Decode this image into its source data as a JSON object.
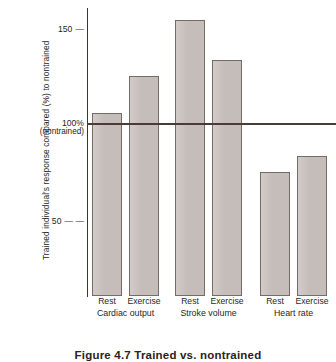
{
  "chart_data": {
    "type": "bar",
    "title": "",
    "caption": "Figure 4.7  Trained vs. nontrained",
    "xlabel": "",
    "ylabel": "Trained individual's response compared (%) to nontrained",
    "ylim": [
      0,
      162
    ],
    "grid": false,
    "legend": "none",
    "yticks": [
      {
        "value": 150,
        "label": "150",
        "dash": "—"
      },
      {
        "value": 100,
        "label": "100%",
        "sublabel": "(nontrained)"
      },
      {
        "value": 50,
        "label": "50",
        "dash": "—  —"
      }
    ],
    "reference_line": {
      "value": 100,
      "label": "100% (nontrained)",
      "color": "#4a3b36"
    },
    "categories": [
      "Rest",
      "Exercise",
      "Rest",
      "Exercise",
      "Rest",
      "Exercise"
    ],
    "groups": [
      {
        "name": "Cardiac output",
        "categories": [
          "Rest",
          "Exercise"
        ],
        "values": [
          103,
          124
        ]
      },
      {
        "name": "Stroke volume",
        "categories": [
          "Rest",
          "Exercise"
        ],
        "values": [
          155,
          133
        ]
      },
      {
        "name": "Heart rate",
        "categories": [
          "Rest",
          "Exercise"
        ],
        "values": [
          70,
          79
        ]
      }
    ],
    "values": [
      103,
      124,
      155,
      133,
      70,
      79
    ],
    "bar_color": "#c5bdba",
    "bar_border_color": "#756b67",
    "axis_color": "#3d3230"
  }
}
